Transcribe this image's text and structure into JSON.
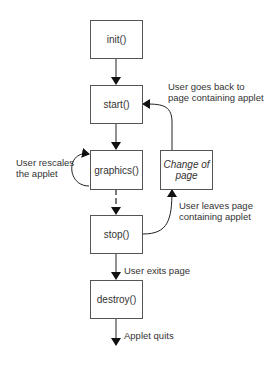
{
  "diagram": {
    "title": "",
    "nodes": [
      {
        "id": "init",
        "label": "init()"
      },
      {
        "id": "start",
        "label": "start()"
      },
      {
        "id": "graphics",
        "label": "graphics()"
      },
      {
        "id": "change",
        "label": "Change of page"
      },
      {
        "id": "stop",
        "label": "stop()"
      },
      {
        "id": "destroy",
        "label": "destroy()"
      }
    ],
    "labels": {
      "goes_back_1": "User goes back to",
      "goes_back_2": "page containing applet",
      "rescales_1": "User rescales",
      "rescales_2": "the applet",
      "leaves_1": "User leaves page",
      "leaves_2": "containing applet",
      "exits": "User exits page",
      "quits": "Applet quits",
      "change_1": "Change of",
      "change_2": "page"
    },
    "edges": [
      {
        "from": "init",
        "to": "start"
      },
      {
        "from": "start",
        "to": "graphics"
      },
      {
        "from": "graphics",
        "to": "graphics",
        "label": "User rescales the applet"
      },
      {
        "from": "graphics",
        "to": "stop"
      },
      {
        "from": "stop",
        "to": "change",
        "label": "User leaves page containing applet"
      },
      {
        "from": "change",
        "to": "start",
        "label": "User goes back to page containing applet"
      },
      {
        "from": "stop",
        "to": "destroy",
        "label": "User exits page"
      },
      {
        "from": "destroy",
        "to": "end",
        "label": "Applet quits"
      }
    ],
    "colors": {
      "line": "#222222",
      "border": "#555555",
      "text": "#333333"
    }
  }
}
